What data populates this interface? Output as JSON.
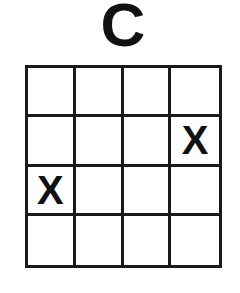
{
  "title": "C",
  "grid": {
    "rows": 4,
    "cols": 4,
    "cells": [
      [
        "",
        "",
        "",
        ""
      ],
      [
        "",
        "",
        "",
        "X"
      ],
      [
        "X",
        "",
        "",
        ""
      ],
      [
        "",
        "",
        "",
        ""
      ]
    ]
  }
}
